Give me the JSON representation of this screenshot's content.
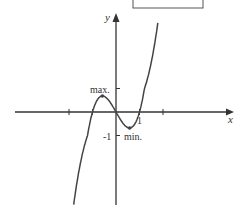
{
  "diagram": {
    "title_box": "",
    "function": "cubic with three real roots (approx. y = x^3 - x shape)",
    "x_axis_label": "x",
    "y_axis_label": "y",
    "x_tick_values": [
      -2,
      -1,
      1,
      2
    ],
    "x_tick_label": "1",
    "y_tick_values": [
      1,
      -1
    ],
    "y_tick_label": "-1",
    "max_label": "max.",
    "min_label": "min.",
    "roots": [
      -1,
      0,
      1
    ],
    "local_max": {
      "x": -0.58,
      "y": 0.68
    },
    "local_min": {
      "x": 0.58,
      "y": -0.68
    },
    "x_range": [
      -1.8,
      1.78
    ],
    "line_color": "#444444"
  }
}
